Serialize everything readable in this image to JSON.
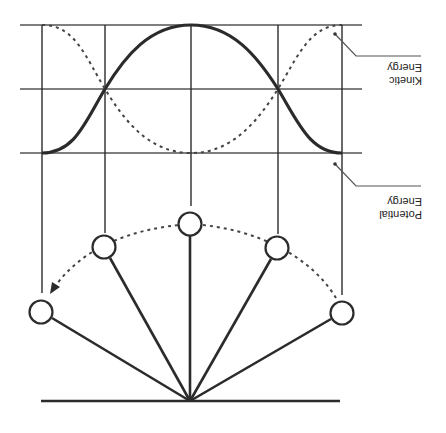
{
  "diagram": {
    "labels": {
      "kinetic_line1": "Kinetic",
      "kinetic_line2": "Energy",
      "potential_line1": "Potential",
      "potential_line2": "Energy"
    },
    "legend": [
      {
        "name": "kinetic-energy",
        "style": "solid"
      },
      {
        "name": "potential-energy",
        "style": "dashed"
      }
    ],
    "pendulum_positions": 5,
    "colors": {
      "stroke": "#2b2b2b",
      "grid": "#555555",
      "background": "#ffffff"
    }
  }
}
